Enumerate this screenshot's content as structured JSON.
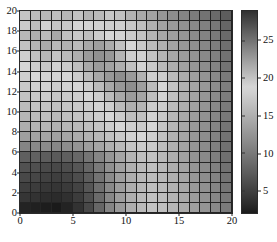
{
  "chart_data": {
    "type": "heatmap",
    "title": "",
    "xlabel": "",
    "ylabel": "",
    "xlim": [
      0,
      20
    ],
    "ylim": [
      0,
      20
    ],
    "grid": true,
    "nx": 20,
    "ny": 20,
    "colormap": "gray",
    "colorbar": {
      "position": "right",
      "ticks": [
        5,
        10,
        15,
        20,
        25
      ],
      "tick_labels": [
        "5",
        "10",
        "15",
        "20",
        "25"
      ],
      "vmin": 2,
      "vmax": 29
    },
    "x_ticks": [
      0,
      5,
      10,
      15,
      20
    ],
    "x_tick_labels": [
      "0",
      "5",
      "10",
      "15",
      "20"
    ],
    "y_ticks": [
      0,
      2,
      4,
      6,
      8,
      10,
      12,
      14,
      16,
      18,
      20
    ],
    "y_tick_labels": [
      "0",
      "2",
      "4",
      "6",
      "8",
      "10",
      "12",
      "14",
      "16",
      "18",
      "20"
    ],
    "row_order": "top_to_bottom",
    "values": [
      [
        17.0,
        16.2,
        15.8,
        16.4,
        15.6,
        16.8,
        15.4,
        16.0,
        17.2,
        16.6,
        15.2,
        14.4,
        13.8,
        12.6,
        11.8,
        11.0,
        10.2,
        9.4,
        8.6,
        7.4
      ],
      [
        19.6,
        20.4,
        19.2,
        20.0,
        19.8,
        18.6,
        19.0,
        18.2,
        19.4,
        18.0,
        17.2,
        16.4,
        15.0,
        13.8,
        13.0,
        12.2,
        11.4,
        10.6,
        9.8,
        8.2
      ],
      [
        20.8,
        21.4,
        20.6,
        21.8,
        20.2,
        19.8,
        20.4,
        19.6,
        18.8,
        18.4,
        17.6,
        16.8,
        15.4,
        14.2,
        13.4,
        12.6,
        11.6,
        10.8,
        10.0,
        8.6
      ],
      [
        20.2,
        21.0,
        21.6,
        20.8,
        21.2,
        20.6,
        21.8,
        22.4,
        21.6,
        20.2,
        18.6,
        17.4,
        16.2,
        15.0,
        13.8,
        12.8,
        12.0,
        11.2,
        10.4,
        9.0
      ],
      [
        19.4,
        20.2,
        20.8,
        20.0,
        20.6,
        21.4,
        22.6,
        23.2,
        22.8,
        21.0,
        19.4,
        18.2,
        16.8,
        15.4,
        14.2,
        13.2,
        12.4,
        11.4,
        10.6,
        9.2
      ],
      [
        18.6,
        19.4,
        19.8,
        19.2,
        19.6,
        20.4,
        21.8,
        22.6,
        22.2,
        21.4,
        20.2,
        19.0,
        17.4,
        16.0,
        14.8,
        13.6,
        12.6,
        11.8,
        10.8,
        9.4
      ],
      [
        18.0,
        18.8,
        19.0,
        18.4,
        18.8,
        19.6,
        20.6,
        21.8,
        22.8,
        23.4,
        22.6,
        21.2,
        19.4,
        17.6,
        16.0,
        14.6,
        13.4,
        12.4,
        11.4,
        10.0
      ],
      [
        17.4,
        18.0,
        18.4,
        17.8,
        18.2,
        18.8,
        19.4,
        20.6,
        21.8,
        22.8,
        23.4,
        22.4,
        20.6,
        18.6,
        16.8,
        15.2,
        14.0,
        12.8,
        11.8,
        10.4
      ],
      [
        16.8,
        17.4,
        17.8,
        17.2,
        17.6,
        18.0,
        18.6,
        19.4,
        20.6,
        21.8,
        22.6,
        22.0,
        20.4,
        18.4,
        16.6,
        15.0,
        13.8,
        12.6,
        11.6,
        10.2
      ],
      [
        16.2,
        16.8,
        17.0,
        16.6,
        17.0,
        17.4,
        17.8,
        18.4,
        19.4,
        20.6,
        21.4,
        21.0,
        19.6,
        17.8,
        16.2,
        14.8,
        13.6,
        12.4,
        11.4,
        10.0
      ],
      [
        15.6,
        16.2,
        16.4,
        16.0,
        16.4,
        16.8,
        17.2,
        17.8,
        18.6,
        19.6,
        20.4,
        20.2,
        19.0,
        17.4,
        15.8,
        14.4,
        13.2,
        12.2,
        11.2,
        9.8
      ],
      [
        14.8,
        15.4,
        15.6,
        15.2,
        15.6,
        16.0,
        16.4,
        17.0,
        17.8,
        18.6,
        19.4,
        19.6,
        18.6,
        17.0,
        15.6,
        14.2,
        13.0,
        12.0,
        11.0,
        9.6
      ],
      [
        13.4,
        13.8,
        14.0,
        13.6,
        14.0,
        14.6,
        15.2,
        15.8,
        16.6,
        17.4,
        18.2,
        18.6,
        18.0,
        16.6,
        15.2,
        14.0,
        12.8,
        11.8,
        10.8,
        9.4
      ],
      [
        11.0,
        11.4,
        11.6,
        11.2,
        11.8,
        12.4,
        13.2,
        14.0,
        15.0,
        16.0,
        17.0,
        17.6,
        17.4,
        16.2,
        15.0,
        13.8,
        12.6,
        11.6,
        10.6,
        9.2
      ],
      [
        7.6,
        7.8,
        7.4,
        7.2,
        7.6,
        8.4,
        9.6,
        11.0,
        12.6,
        14.0,
        15.4,
        16.4,
        16.6,
        15.8,
        14.8,
        13.6,
        12.4,
        11.4,
        10.4,
        9.0
      ],
      [
        6.4,
        6.2,
        5.8,
        5.6,
        6.0,
        6.8,
        8.2,
        10.0,
        12.0,
        13.6,
        15.0,
        16.0,
        16.4,
        15.8,
        14.8,
        13.8,
        12.6,
        11.6,
        10.6,
        9.2
      ],
      [
        5.6,
        5.4,
        5.0,
        4.8,
        5.2,
        6.0,
        7.4,
        9.4,
        11.6,
        13.4,
        14.8,
        15.8,
        16.2,
        15.8,
        15.0,
        14.0,
        12.8,
        11.8,
        10.8,
        9.4
      ],
      [
        4.8,
        4.6,
        4.2,
        4.0,
        4.4,
        5.2,
        6.8,
        9.0,
        11.4,
        13.2,
        14.8,
        15.8,
        16.4,
        16.0,
        15.2,
        14.2,
        13.0,
        12.0,
        11.0,
        9.6
      ],
      [
        4.0,
        3.8,
        3.4,
        3.2,
        3.6,
        4.6,
        6.2,
        8.6,
        11.2,
        13.2,
        14.8,
        16.0,
        16.6,
        16.2,
        15.4,
        14.4,
        13.2,
        12.2,
        11.2,
        9.8
      ],
      [
        2.6,
        2.4,
        2.2,
        2.0,
        2.6,
        3.8,
        5.6,
        8.2,
        11.0,
        13.0,
        14.8,
        16.0,
        16.8,
        16.4,
        15.6,
        14.6,
        13.4,
        12.4,
        11.4,
        10.0
      ]
    ]
  },
  "axes": {
    "x_label": "",
    "y_label": ""
  }
}
